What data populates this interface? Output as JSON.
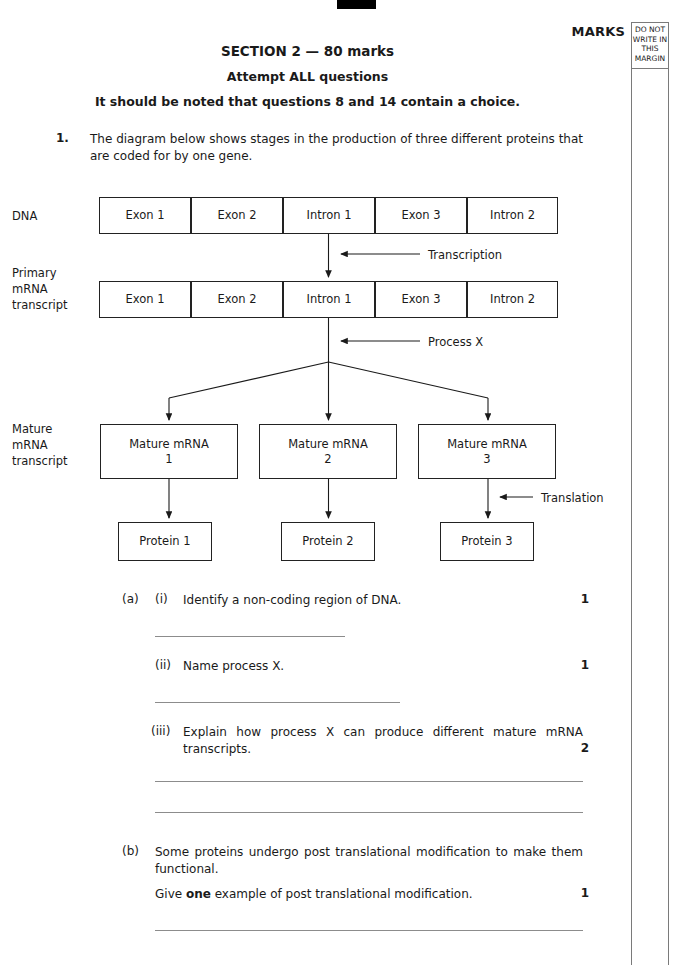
{
  "header": {
    "marks_label": "MARKS",
    "margin_note": "DO NOT WRITE IN THIS MARGIN",
    "section_title": "SECTION 2 — 80 marks",
    "attempt_line": "Attempt ALL questions",
    "choice_note": "It should be noted that questions 8 and 14 contain a choice."
  },
  "question": {
    "number": "1.",
    "stem": "The diagram below shows stages in the production of three different proteins that are coded for by one gene."
  },
  "diagram": {
    "row_labels": {
      "dna": "DNA",
      "primary": "Primary\nmRNA\ntranscript",
      "primary_l1": "Primary",
      "primary_l2": "mRNA",
      "primary_l3": "transcript",
      "mature_l1": "Mature",
      "mature_l2": "mRNA",
      "mature_l3": "transcript"
    },
    "dna_segments": [
      "Exon 1",
      "Exon 2",
      "Intron 1",
      "Exon 3",
      "Intron 2"
    ],
    "primary_segments": [
      "Exon 1",
      "Exon 2",
      "Intron 1",
      "Exon 3",
      "Intron 2"
    ],
    "mature_boxes": [
      {
        "line1": "Mature mRNA",
        "line2": "1"
      },
      {
        "line1": "Mature mRNA",
        "line2": "2"
      },
      {
        "line1": "Mature mRNA",
        "line2": "3"
      }
    ],
    "protein_boxes": [
      "Protein 1",
      "Protein 2",
      "Protein 3"
    ],
    "arrow_labels": {
      "transcription": "Transcription",
      "process_x": "Process X",
      "translation": "Translation"
    }
  },
  "parts": {
    "a_label": "(a)",
    "b_label": "(b)",
    "i_label": "(i)",
    "ii_label": "(ii)",
    "iii_label": "(iii)",
    "a_i_text": "Identify a non-coding region of DNA.",
    "a_i_marks": "1",
    "a_ii_text": "Name process X.",
    "a_ii_marks": "1",
    "a_iii_text": "Explain how process X can produce different mature mRNA transcripts.",
    "a_iii_marks": "2",
    "b_text_line1": "Some proteins undergo post translational modification to make them functional.",
    "b_text_line2_pre": "Give ",
    "b_text_line2_bold": "one",
    "b_text_line2_post": " example of post translational modification.",
    "b_marks": "1"
  },
  "colors": {
    "ink": "#1a1a1a",
    "box_border": "#222222",
    "rule": "#8c8c8c",
    "margin_rule": "#7a7a7a"
  }
}
